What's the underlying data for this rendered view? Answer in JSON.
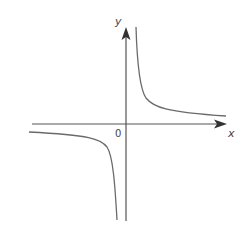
{
  "figure": {
    "type": "graph of a rectangular hyperbola y = k/x (k > 0)",
    "axes": {
      "x_label": "x",
      "y_label": "y",
      "origin_label": "0"
    },
    "curve": {
      "branches": [
        "upper-right quadrant (I)",
        "lower-left quadrant (III)"
      ],
      "asymptotes": [
        "x-axis",
        "y-axis"
      ]
    },
    "colors": {
      "axis": "#555555",
      "curve": "#6a6a6a",
      "arrow": "#333333",
      "background": "#ffffff"
    }
  }
}
